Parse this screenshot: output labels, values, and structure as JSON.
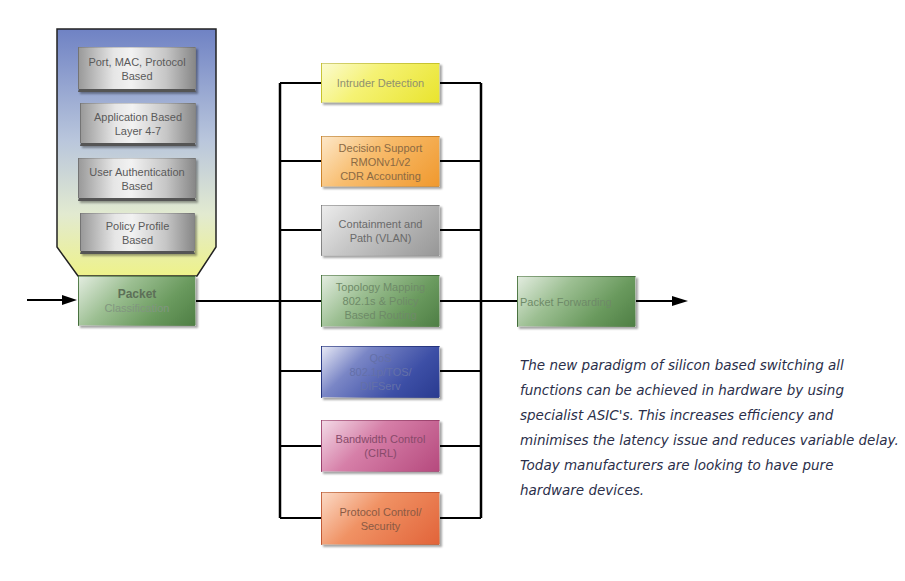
{
  "diagram": {
    "input_arrow": {
      "direction": "right"
    },
    "classification_criteria": {
      "items": [
        {
          "label": "Port, MAC, Protocol\nBased"
        },
        {
          "label": "Application Based\nLayer 4-7"
        },
        {
          "label": "User Authentication\nBased"
        },
        {
          "label": "Policy Profile\nBased"
        }
      ],
      "colors": {
        "top": "#6f82c4",
        "bottom": "#eef28a"
      }
    },
    "packet_classification": {
      "title": "Packet",
      "subtitle": "Classification",
      "color": "#6a9a5e"
    },
    "functions": [
      {
        "label": "Intruder Detection",
        "color": "#f5f274"
      },
      {
        "label": "Decision Support\nRMONv1/v2\nCDR Accounting",
        "color": "#f8bd6e"
      },
      {
        "label": "Containment and\nPath (VLAN)",
        "color": "#c6c6c6"
      },
      {
        "label": "Topology Mapping\n802.1s & Policy\nBased Routing",
        "color": "#7ea970"
      },
      {
        "label": "QoS\n802.1p/TOS/\nDIFServ",
        "color": "#3d4fa6"
      },
      {
        "label": "Bandwidth Control\n(CIRL)",
        "color": "#d67fa8"
      },
      {
        "label": "Protocol Control/\nSecurity",
        "color": "#f09264"
      }
    ],
    "packet_forwarding": {
      "label": "Packet Forwarding",
      "color": "#6a9a5e"
    },
    "output_arrow": {
      "direction": "right"
    }
  },
  "caption": {
    "text": "The new paradigm of silicon based switching all functions can be achieved in hardware by using specialist ASIC's. This increases efficiency and minimises the latency issue and reduces variable delay. Today manufacturers are looking to have pure hardware devices."
  }
}
